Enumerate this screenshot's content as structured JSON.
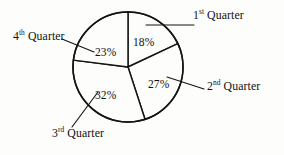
{
  "figure": {
    "background_color": "#fdfdfb",
    "ink_color": "#141414"
  },
  "chart_data": {
    "type": "pie",
    "title": "",
    "subtitle": "",
    "xlabel": "",
    "ylabel": "",
    "legend_position": "callout-labels",
    "grid": false,
    "start_angle_deg": 0,
    "direction": "clockwise",
    "categories": [
      "1st Quarter",
      "2nd Quarter",
      "3rd Quarter",
      "4th Quarter"
    ],
    "values": [
      18,
      27,
      32,
      23
    ],
    "value_labels": [
      "18%",
      "27%",
      "32%",
      "23%"
    ],
    "units": "percent",
    "total": 100,
    "slices": [
      {
        "label": "1st Quarter",
        "ordinal_number": "1",
        "ordinal_suffix": "st",
        "noun": "Quarter",
        "value": 18,
        "value_label": "18%",
        "start_angle_deg": 0,
        "end_angle_deg": 64.8,
        "fill": "#fdfdfb"
      },
      {
        "label": "2nd Quarter",
        "ordinal_number": "2",
        "ordinal_suffix": "nd",
        "noun": "Quarter",
        "value": 27,
        "value_label": "27%",
        "start_angle_deg": 64.8,
        "end_angle_deg": 162.0,
        "fill": "#fdfdfb"
      },
      {
        "label": "3rd Quarter",
        "ordinal_number": "3",
        "ordinal_suffix": "rd",
        "noun": "Quarter",
        "value": 32,
        "value_label": "32%",
        "start_angle_deg": 162.0,
        "end_angle_deg": 277.2,
        "fill": "#fdfdfb"
      },
      {
        "label": "4th Quarter",
        "ordinal_number": "4",
        "ordinal_suffix": "th",
        "noun": "Quarter",
        "value": 23,
        "value_label": "23%",
        "start_angle_deg": 277.2,
        "end_angle_deg": 360.0,
        "fill": "#fdfdfb"
      }
    ]
  }
}
